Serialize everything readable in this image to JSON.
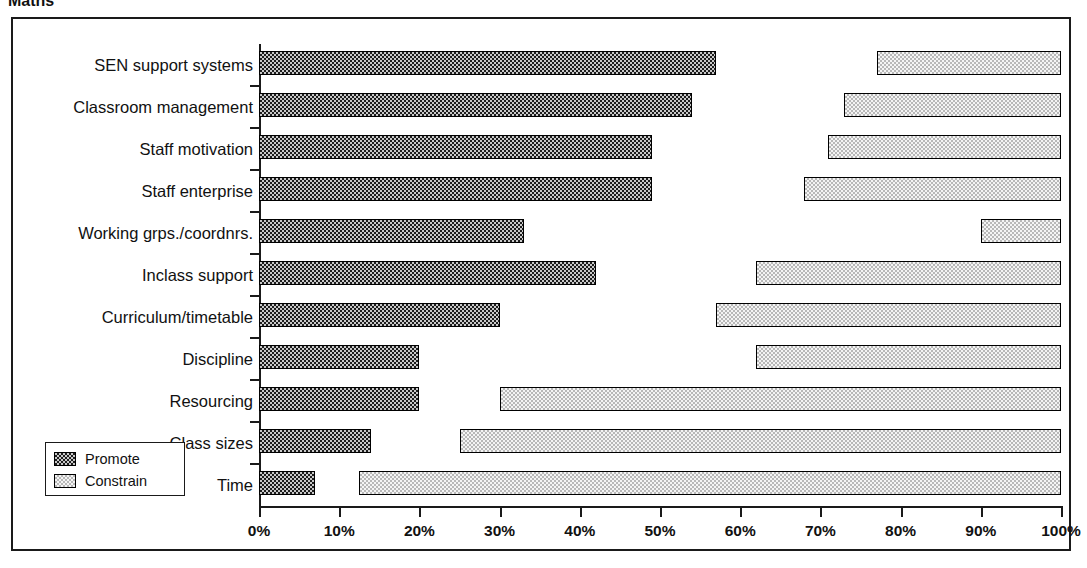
{
  "chart_data": {
    "type": "bar",
    "orientation": "horizontal",
    "stacked_opposed": true,
    "title": "Maths",
    "xlabel": "",
    "ylabel": "",
    "xlim": [
      0,
      100
    ],
    "grid": false,
    "legend_position": "bottom-left",
    "axis_unit": "%",
    "categories": [
      "SEN support systems",
      "Classroom management",
      "Staff motivation",
      "Staff enterprise",
      "Working grps./coordnrs.",
      "Inclass support",
      "Curriculum/timetable",
      "Discipline",
      "Resourcing",
      "Class sizes",
      "Time"
    ],
    "xticks": [
      0,
      10,
      20,
      30,
      40,
      50,
      60,
      70,
      80,
      90,
      100
    ],
    "xtick_labels": [
      "0%",
      "10%",
      "20%",
      "30%",
      "40%",
      "50%",
      "60%",
      "70%",
      "80%",
      "90%",
      "100%"
    ],
    "series": [
      {
        "name": "Promote",
        "anchor": "left",
        "values": [
          57,
          54,
          49,
          49,
          33,
          42,
          30,
          20,
          20,
          14,
          7
        ]
      },
      {
        "name": "Constrain",
        "anchor": "right",
        "start_values": [
          77,
          73,
          71,
          68,
          90,
          62,
          57,
          62,
          30,
          25,
          12.5
        ],
        "end_value": 100,
        "values": [
          23,
          27,
          29,
          32,
          10,
          38,
          43,
          38,
          70,
          75,
          87.5
        ]
      }
    ],
    "legend": [
      {
        "label": "Promote",
        "swatch": "dark-checker"
      },
      {
        "label": "Constrain",
        "swatch": "light-checker"
      }
    ]
  },
  "colors": {
    "promote_fill": "#2b2b2b",
    "constrain_fill": "#e6e6e6",
    "outline": "#1a1a1a",
    "background": "#ffffff",
    "text": "#111111"
  }
}
